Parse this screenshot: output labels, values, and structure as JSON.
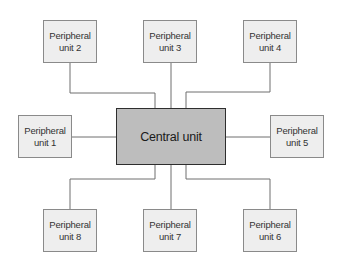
{
  "diagram": {
    "type": "star-topology",
    "central": {
      "label": "Central unit",
      "fill": "#bdbdbd",
      "border": "#2e2e2e"
    },
    "peripherals": [
      {
        "id": 1,
        "line1": "Peripheral",
        "line2": "unit 1",
        "position": "left"
      },
      {
        "id": 2,
        "line1": "Peripheral",
        "line2": "unit 2",
        "position": "top-left"
      },
      {
        "id": 3,
        "line1": "Peripheral",
        "line2": "unit 3",
        "position": "top"
      },
      {
        "id": 4,
        "line1": "Peripheral",
        "line2": "unit 4",
        "position": "top-right"
      },
      {
        "id": 5,
        "line1": "Peripheral",
        "line2": "unit 5",
        "position": "right"
      },
      {
        "id": 6,
        "line1": "Peripheral",
        "line2": "unit 6",
        "position": "bottom-right"
      },
      {
        "id": 7,
        "line1": "Peripheral",
        "line2": "unit 7",
        "position": "bottom"
      },
      {
        "id": 8,
        "line1": "Peripheral",
        "line2": "unit 8",
        "position": "bottom-left"
      }
    ],
    "peripheral_fill": "#eeeeee",
    "connector_color": "#6e6e6e"
  }
}
